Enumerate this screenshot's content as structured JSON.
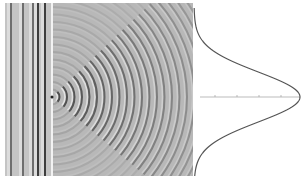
{
  "figure": {
    "wave_panel": {
      "x": 5,
      "y": 3,
      "width": 188,
      "height": 173,
      "background": "#b8b8b8",
      "plane_wave_region_end_x": 52,
      "plane_wave_crests_x": [
        10,
        22,
        32,
        37,
        44
      ],
      "barrier_x": 52,
      "slit_center_y": 97,
      "source": {
        "x": 52,
        "y": 97
      },
      "ring_spacing": 7.5,
      "ring_count": 24,
      "ring_color": "#4a4a4a",
      "ring_light_color": "#e6e6e6"
    },
    "intensity_plot": {
      "axis_y": 97,
      "axis_x_start": 200,
      "axis_x_end": 300,
      "axis_color": "#aaaaaa",
      "tick_x": [
        215,
        237,
        259,
        281
      ],
      "curve_base_x": 194,
      "curve_peak_x": 300,
      "curve_peak_y": 97,
      "curve_sigma": 25,
      "curve_y_start": 8,
      "curve_y_end": 176,
      "curve_color": "#555555"
    }
  }
}
